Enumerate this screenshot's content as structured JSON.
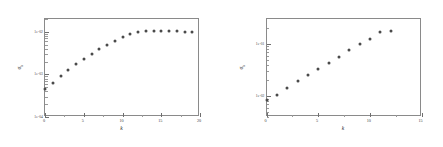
{
  "figure": {
    "background": "#ffffff",
    "marker_color": "#4a4a4a",
    "axis_color": "#8a8a8a"
  },
  "chart_data": [
    {
      "type": "scatter",
      "panel": "left",
      "title": "",
      "xlabel": "k",
      "ylabel": "σ",
      "ylabel_sub": "k",
      "yscale": "log",
      "xscale": "linear",
      "xlim": [
        0,
        20
      ],
      "ylim": [
        0.0001,
        0.02
      ],
      "grid": false,
      "legend": null,
      "xticks": [
        0,
        5,
        10,
        15,
        20
      ],
      "xtick_labels": [
        "0",
        "5",
        "10",
        "15",
        "20"
      ],
      "yticks": [
        0.0001,
        0.001,
        0.01
      ],
      "ytick_labels": [
        "1e-04",
        "1e-03",
        "1e-02"
      ],
      "x": [
        0,
        1,
        2,
        3,
        4,
        5,
        6,
        7,
        8,
        9,
        10,
        11,
        12,
        13,
        14,
        15,
        16,
        17,
        18,
        19
      ],
      "y": [
        0.00045,
        0.00063,
        0.00092,
        0.00128,
        0.00175,
        0.00235,
        0.00305,
        0.00395,
        0.005,
        0.00625,
        0.00775,
        0.009,
        0.00975,
        0.0102,
        0.0103,
        0.0103,
        0.01025,
        0.0102,
        0.0101,
        0.01005
      ]
    },
    {
      "type": "scatter",
      "panel": "right",
      "title": "",
      "xlabel": "k",
      "ylabel": "σ",
      "ylabel_sub": "k",
      "yscale": "log",
      "xscale": "linear",
      "xlim": [
        0,
        15
      ],
      "ylim": [
        0.004,
        0.3
      ],
      "grid": false,
      "legend": null,
      "xticks": [
        0,
        5,
        10,
        15
      ],
      "xtick_labels": [
        "0",
        "5",
        "10",
        "15"
      ],
      "yticks": [
        0.01,
        0.1
      ],
      "ytick_labels": [
        "1e-02",
        "1e-01"
      ],
      "x": [
        0,
        1,
        2,
        3,
        4,
        5,
        6,
        7,
        8,
        9,
        10,
        11,
        12
      ],
      "y": [
        0.0085,
        0.0105,
        0.0145,
        0.0195,
        0.025,
        0.033,
        0.044,
        0.057,
        0.076,
        0.098,
        0.122,
        0.17,
        0.175
      ]
    }
  ]
}
